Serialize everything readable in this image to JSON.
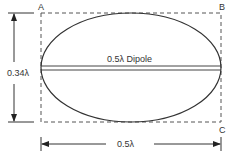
{
  "diagram": {
    "corner_labels": {
      "a": "A",
      "b": "B",
      "c": "C"
    },
    "dipole_label": "0.5λ Dipole",
    "height_label": "0.34λ",
    "width_label": "0.5λ",
    "stroke_color": "#333333"
  }
}
